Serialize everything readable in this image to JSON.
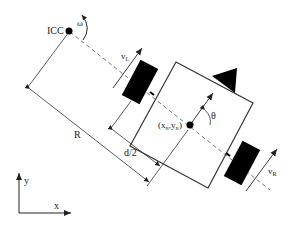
{
  "diagram": {
    "labels": {
      "icc": "ICC",
      "omega": "ω",
      "v_left": "v",
      "v_left_sub": "L",
      "v_right": "v",
      "v_right_sub": "R",
      "theta": "θ",
      "position": "(x",
      "position_sub1": "R",
      "position_mid": ",y",
      "position_sub2": "R",
      "position_end": ")",
      "radius": "R",
      "half_width": "d/2",
      "axis_x": "x",
      "axis_y": "y"
    },
    "colors": {
      "line": "#333333",
      "fill": "#000000",
      "background": "#ffffff"
    }
  }
}
